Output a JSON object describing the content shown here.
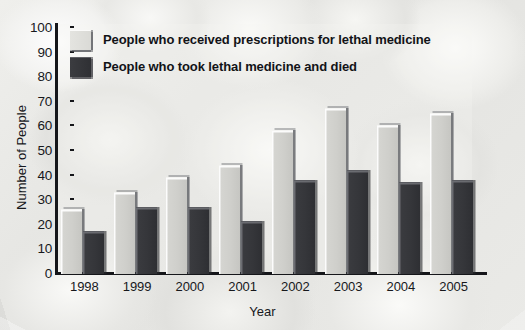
{
  "chart_data": {
    "type": "bar",
    "title": "",
    "xlabel": "Year",
    "ylabel": "Number of People",
    "categories": [
      "1998",
      "1999",
      "2000",
      "2001",
      "2002",
      "2003",
      "2004",
      "2005"
    ],
    "ylim": [
      0,
      100
    ],
    "ytick_step": 10,
    "yticks": [
      "100",
      "90",
      "80",
      "70",
      "60",
      "50",
      "40",
      "30",
      "20",
      "10",
      "0"
    ],
    "grid": false,
    "legend_position": "top-left-inside",
    "series": [
      {
        "name": "People who received prescriptions for lethal medicine",
        "color": "#d2d2ce",
        "values": [
          26,
          33,
          39,
          44,
          58,
          67,
          60,
          65
        ]
      },
      {
        "name": "People who took lethal medicine and died",
        "color": "#35363a",
        "values": [
          17,
          27,
          27,
          21,
          38,
          42,
          37,
          38
        ]
      }
    ]
  },
  "legend": {
    "items": [
      {
        "label": "People who received prescriptions for lethal medicine",
        "swatch": "light"
      },
      {
        "label": "People who took lethal medicine and died",
        "swatch": "dark"
      }
    ]
  }
}
